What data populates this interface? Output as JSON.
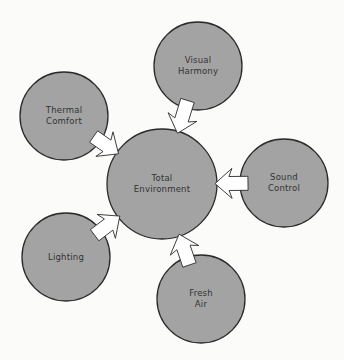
{
  "diagram": {
    "center": {
      "label": "Total\nEnvironment",
      "cx": 162,
      "cy": 184,
      "r": 55
    },
    "nodes": [
      {
        "id": "visual-harmony",
        "label": "Visual\nHarmony",
        "cx": 198,
        "cy": 66,
        "r": 44
      },
      {
        "id": "thermal-comfort",
        "label": "Thermal\nComfort",
        "cx": 64,
        "cy": 116,
        "r": 44
      },
      {
        "id": "sound-control",
        "label": "Sound\nControl",
        "cx": 284,
        "cy": 183,
        "r": 44
      },
      {
        "id": "lighting",
        "label": "Lighting",
        "cx": 66,
        "cy": 257,
        "r": 44
      },
      {
        "id": "fresh-air",
        "label": "Fresh\nAir",
        "cx": 201,
        "cy": 299,
        "r": 44
      }
    ],
    "colors": {
      "circle_fill": "#a3a3a3",
      "circle_stroke": "#2a2a2a",
      "arrow_fill": "#ffffff",
      "background": "#fbfbfa"
    }
  }
}
